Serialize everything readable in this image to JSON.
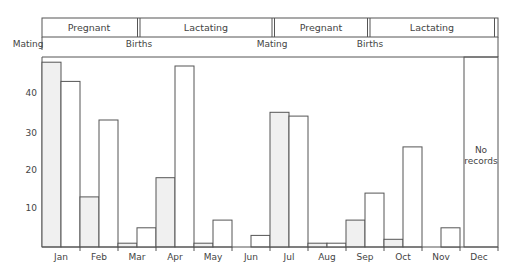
{
  "chart_data": {
    "type": "bar",
    "title": "",
    "xlabel": "",
    "ylabel": "",
    "ylim": [
      0,
      50
    ],
    "yticks": [
      10,
      20,
      30,
      40
    ],
    "grid": false,
    "categories": [
      "Jan",
      "Feb",
      "Mar",
      "Apr",
      "May",
      "Jun",
      "Jul",
      "Aug",
      "Sep",
      "Oct",
      "Nov",
      "Dec"
    ],
    "series": [
      {
        "name": "First half of month (shaded)",
        "values": [
          48,
          13,
          1,
          18,
          1,
          0,
          35,
          1,
          7,
          2,
          0,
          null
        ]
      },
      {
        "name": "Second half of month (open)",
        "values": [
          43,
          33,
          5,
          47,
          7,
          3,
          34,
          1,
          14,
          26,
          5,
          null
        ]
      }
    ],
    "annotations": [
      {
        "month": "Dec",
        "text": "No records"
      }
    ],
    "reproductive_phases": [
      {
        "label": "Pregnant",
        "start_month": "Jan",
        "end_month": "Mar"
      },
      {
        "label": "Lactating",
        "start_month": "Apr",
        "end_month": "Jun"
      },
      {
        "label": "Pregnant",
        "start_month": "Jul",
        "end_month": "Sep"
      },
      {
        "label": "Lactating",
        "start_month": "Oct",
        "end_month": "Dec"
      }
    ],
    "events": [
      {
        "label": "Mating",
        "month": "Jan"
      },
      {
        "label": "Births",
        "month": "Apr"
      },
      {
        "label": "Mating",
        "month": "Jul"
      },
      {
        "label": "Births",
        "month": "Oct"
      }
    ]
  },
  "header": {
    "phases": [
      "Pregnant",
      "Lactating",
      "Pregnant",
      "Lactating"
    ],
    "events": [
      "Mating",
      "Births",
      "Mating",
      "Births"
    ]
  },
  "axis": {
    "y_ticks": [
      "40",
      "30",
      "20",
      "10"
    ],
    "months": [
      "Jan",
      "Feb",
      "Mar",
      "Apr",
      "May",
      "Jun",
      "Jul",
      "Aug",
      "Sep",
      "Oct",
      "Nov",
      "Dec"
    ]
  },
  "no_records": {
    "line1": "No",
    "line2": "records"
  }
}
